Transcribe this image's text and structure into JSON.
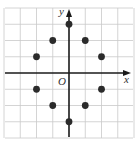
{
  "chart_data": {
    "type": "scatter",
    "title": "",
    "xlabel": "x",
    "ylabel": "y",
    "origin_label": "O",
    "xlim": [
      -4,
      4
    ],
    "ylim": [
      -4,
      4
    ],
    "grid": true,
    "grid_step": 1,
    "tick_labels": false,
    "points": [
      {
        "x": 0,
        "y": 3
      },
      {
        "x": -1,
        "y": 2
      },
      {
        "x": 1,
        "y": 2
      },
      {
        "x": -2,
        "y": 1
      },
      {
        "x": 2,
        "y": 1
      },
      {
        "x": -2,
        "y": -1
      },
      {
        "x": 2,
        "y": -1
      },
      {
        "x": -1,
        "y": -2
      },
      {
        "x": 1,
        "y": -2
      },
      {
        "x": 0,
        "y": -3
      }
    ],
    "point_color": "#2b2b2b",
    "grid_color": "#c9c9c9",
    "axis_color": "#1a1a1a"
  }
}
